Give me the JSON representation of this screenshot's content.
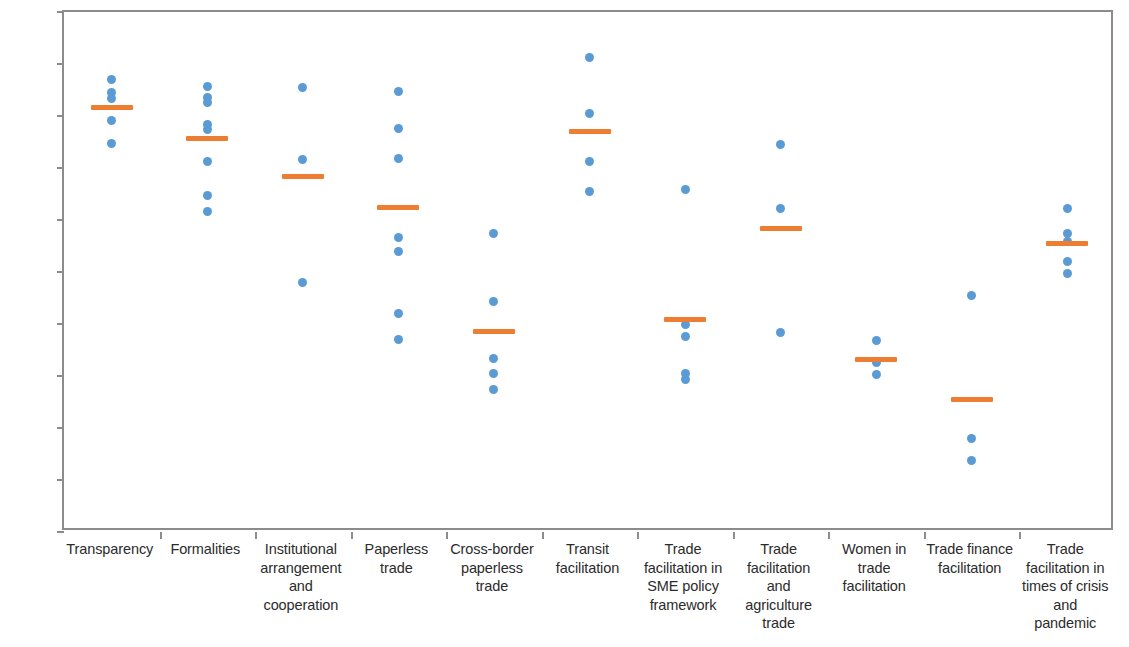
{
  "chart_data": {
    "type": "scatter",
    "title": "",
    "xlabel": "",
    "ylabel": "",
    "ylim": [
      0,
      100
    ],
    "grid": false,
    "legend": "none",
    "y_unit": "%",
    "y_ticks": [
      "0%",
      "10%",
      "20%",
      "30%",
      "40%",
      "50%",
      "60%",
      "70%",
      "80%",
      "90%",
      "100%"
    ],
    "y_tick_values": [
      0,
      10,
      20,
      30,
      40,
      50,
      60,
      70,
      80,
      90,
      100
    ],
    "categories": [
      "Transparency",
      "Formalities",
      "Institutional\narrangement\nand\ncooperation",
      "Paperless\ntrade",
      "Cross-border\npaperless\ntrade",
      "Transit\nfacilitation",
      "Trade\nfacilitation in\nSME policy\nframework",
      "Trade\nfacilitation\nand\nagriculture\ntrade",
      "Women in\ntrade\nfacilitation",
      "Trade finance\nfacilitation",
      "Trade\nfacilitation in\ntimes of crisis\nand\npandemic"
    ],
    "series": [
      {
        "name": "Economy scores",
        "marker": "dot",
        "color": "#5b9bd5",
        "values_by_category": [
          [
            87.0,
            84.5,
            83.3,
            79.2,
            74.8
          ],
          [
            85.6,
            83.6,
            82.6,
            78.3,
            77.4,
            71.2,
            64.7,
            61.7
          ],
          [
            85.5,
            71.7,
            48.0
          ],
          [
            84.7,
            77.6,
            71.8,
            56.7,
            53.9,
            42.1,
            37.0
          ],
          [
            57.4,
            44.3,
            33.3,
            30.5,
            27.5
          ],
          [
            91.2,
            80.5,
            71.2,
            65.4
          ],
          [
            65.8,
            39.9,
            37.6,
            30.4,
            29.4
          ],
          [
            74.6,
            62.3,
            38.3
          ],
          [
            36.8,
            32.6,
            30.2
          ],
          [
            45.5,
            18.0,
            13.7
          ],
          [
            62.2,
            57.4,
            55.9,
            52.0,
            49.7
          ]
        ]
      },
      {
        "name": "Average",
        "marker": "bar",
        "color": "#ed7d31",
        "values_by_category": [
          81.7,
          75.6,
          68.4,
          62.5,
          38.6,
          77.1,
          40.8,
          58.4,
          33.2,
          25.4,
          55.4
        ]
      }
    ]
  }
}
